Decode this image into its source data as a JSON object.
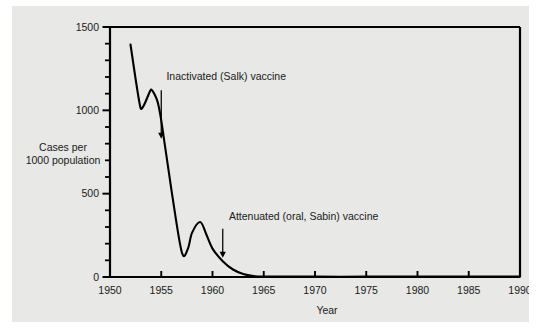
{
  "figure": {
    "background_color": "#ffffff",
    "panel_color": "#e8e8e6",
    "line_color": "#000000",
    "text_color": "#1a1a1a"
  },
  "chart_data": {
    "type": "line",
    "title": "",
    "xlabel": "Year",
    "ylabel": "Cases per 1000 population",
    "ylabel_line1": "Cases per",
    "ylabel_line2": "1000 population",
    "xlim": [
      1950,
      1990
    ],
    "ylim": [
      0,
      1500
    ],
    "grid": false,
    "legend": "none",
    "x_ticks": [
      1950,
      1955,
      1960,
      1965,
      1970,
      1975,
      1980,
      1985,
      1990
    ],
    "x_tick_labels": [
      "1950",
      "1955",
      "1960",
      "1965",
      "1970",
      "1975",
      "1980",
      "1985",
      "1990"
    ],
    "y_ticks": [
      0,
      500,
      1000,
      1500
    ],
    "y_tick_labels": [
      "0",
      "500",
      "1000",
      "1500"
    ],
    "y_minor_tick_step": 100,
    "series": [
      {
        "name": "Polio cases per 1000 population",
        "x": [
          1952,
          1953,
          1954,
          1954.6,
          1955,
          1956,
          1957,
          1957.6,
          1958,
          1958.8,
          1959.4,
          1960,
          1961,
          1962,
          1963,
          1964,
          1965,
          1970,
          1975,
          1980,
          1985,
          1990
        ],
        "y": [
          1395,
          1010,
          1125,
          1060,
          940,
          520,
          150,
          170,
          265,
          330,
          255,
          170,
          95,
          45,
          18,
          6,
          3,
          2,
          2,
          2,
          2,
          2
        ]
      }
    ],
    "annotations": [
      {
        "label": "Inactivated (Salk) vaccine",
        "arrow_x": 1955,
        "arrow_y_top": 1120,
        "arrow_y_tip": 830,
        "text_x": 1955.5,
        "text_y": 1180
      },
      {
        "label": "Attenuated (oral, Sabin) vaccine",
        "arrow_x": 1961,
        "arrow_y_top": 290,
        "arrow_y_tip": 115,
        "text_x": 1961.6,
        "text_y": 345
      }
    ]
  }
}
